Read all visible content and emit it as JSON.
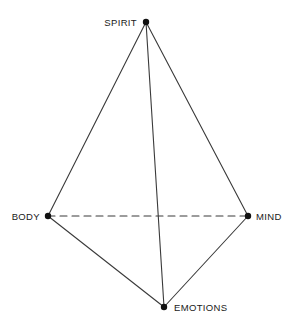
{
  "diagram": {
    "type": "tetrahedron",
    "title": "",
    "background_color": "#ffffff",
    "stroke_color": "#3a3a3a",
    "vertex_color": "#111111",
    "label_color": "#1a1a1a",
    "canvas": {
      "width": 295,
      "height": 328
    },
    "vertices": [
      {
        "id": "spirit",
        "label": "SPIRIT",
        "x": 146,
        "y": 22,
        "label_x": 137,
        "label_y": 23,
        "label_align": "right"
      },
      {
        "id": "body",
        "label": "BODY",
        "x": 48,
        "y": 216,
        "label_x": 40,
        "label_y": 217,
        "label_align": "right"
      },
      {
        "id": "mind",
        "label": "MIND",
        "x": 248,
        "y": 216,
        "label_x": 256,
        "label_y": 217,
        "label_align": "left"
      },
      {
        "id": "emotions",
        "label": "EMOTIONS",
        "x": 164,
        "y": 307,
        "label_x": 174,
        "label_y": 308,
        "label_align": "left"
      }
    ],
    "edges": [
      {
        "id": "spirit-body",
        "from": "spirit",
        "to": "body",
        "style": "solid"
      },
      {
        "id": "spirit-mind",
        "from": "spirit",
        "to": "mind",
        "style": "solid"
      },
      {
        "id": "spirit-emotions",
        "from": "spirit",
        "to": "emotions",
        "style": "solid"
      },
      {
        "id": "body-emotions",
        "from": "body",
        "to": "emotions",
        "style": "solid"
      },
      {
        "id": "mind-emotions",
        "from": "mind",
        "to": "emotions",
        "style": "solid"
      },
      {
        "id": "body-mind",
        "from": "body",
        "to": "mind",
        "style": "dashed"
      }
    ],
    "stroke_width": 1.1,
    "vertex_radius": 3.2,
    "dash_pattern": "7 5"
  }
}
